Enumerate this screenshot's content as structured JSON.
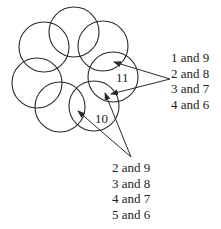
{
  "diagram": {
    "circles": [
      {
        "id": "top",
        "cx": 74,
        "cy": 32,
        "r": 25
      },
      {
        "id": "top-left",
        "cx": 44,
        "cy": 47,
        "r": 25
      },
      {
        "id": "top-right",
        "cx": 103,
        "cy": 46,
        "r": 25
      },
      {
        "id": "left",
        "cx": 37,
        "cy": 83,
        "r": 25
      },
      {
        "id": "right",
        "cx": 113,
        "cy": 77,
        "r": 25
      },
      {
        "id": "bottom-left",
        "cx": 60,
        "cy": 107,
        "r": 25
      },
      {
        "id": "bottom",
        "cx": 94,
        "cy": 106,
        "r": 25
      }
    ],
    "region_labels": {
      "eleven": "11",
      "ten": "10"
    },
    "right_group": {
      "lines": [
        "1 and 9",
        "2 and 8",
        "3 and 7",
        "4 and 6"
      ]
    },
    "bottom_group": {
      "lines": [
        "2 and 9",
        "3 and 8",
        "4 and 7",
        "5 and 6"
      ]
    },
    "line_color": "#2a2a2a"
  }
}
